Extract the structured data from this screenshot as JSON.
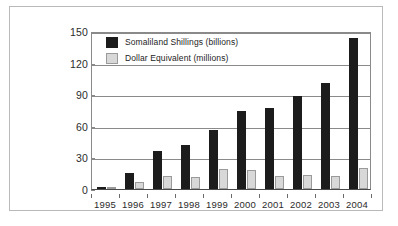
{
  "chart_data": {
    "type": "bar",
    "title": "",
    "subtitle": "",
    "xlabel": "",
    "ylabel": "",
    "categories": [
      "1995",
      "1996",
      "1997",
      "1998",
      "1999",
      "2000",
      "2001",
      "2002",
      "2003",
      "2004"
    ],
    "series": [
      {
        "name": "Somaliland Shillings (billions)",
        "color": "#1c1c1c",
        "values": [
          2,
          15,
          36,
          42,
          56,
          74,
          77,
          88,
          101,
          143
        ]
      },
      {
        "name": "Dollar Equivalent (millions)",
        "color": "#d8d8d8",
        "values": [
          0.5,
          7,
          12,
          11,
          19,
          18,
          12,
          13,
          12,
          20
        ]
      }
    ],
    "ylim": [
      0,
      150
    ],
    "yticks": [
      0,
      30,
      60,
      90,
      120,
      150
    ],
    "ytick_labels": [
      "0",
      "30",
      "60",
      "90",
      "120",
      "150"
    ],
    "grid": true,
    "grid_axis": "y",
    "legend_position": "top-left"
  },
  "legend": {
    "entries": [
      {
        "label": "Somaliland Shillings (billions)"
      },
      {
        "label": "Dollar Equivalent (millions)"
      }
    ]
  },
  "colors": {
    "series_dark": "#1c1c1c",
    "series_light": "#d8d8d8",
    "gridline": "#8a8a8a",
    "frame": "#b9b9b9",
    "text": "#2b2b2b",
    "background": "#ffffff"
  }
}
